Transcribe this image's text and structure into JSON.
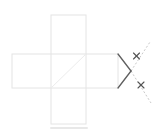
{
  "canvas": {
    "width": 160,
    "height": 134,
    "background": "#ffffff"
  },
  "colors": {
    "net_outline": "#e4e4e4",
    "fold_diagonal": "#ececec",
    "solid_ray": "#5f5f5f",
    "dashed_ray": "#c9c9c9",
    "cross_mark": "#545454",
    "shadow": "#d9d9d9"
  },
  "net": {
    "rects": [
      {
        "name": "horizontal-bar",
        "x": 12,
        "y": 54,
        "width": 106,
        "height": 34
      },
      {
        "name": "vertical-bar",
        "x": 51,
        "y": 15,
        "width": 35,
        "height": 109
      }
    ],
    "diagonal": {
      "x1": 51,
      "y1": 88,
      "x2": 86,
      "y2": 54
    }
  },
  "rays": {
    "solid": [
      {
        "name": "upper",
        "x1": 118,
        "y1": 54,
        "x2": 131,
        "y2": 71
      },
      {
        "name": "lower",
        "x1": 118,
        "y1": 88,
        "x2": 131,
        "y2": 71
      }
    ],
    "dashed": [
      {
        "name": "upper",
        "x1": 131,
        "y1": 71,
        "x2": 150,
        "y2": 42
      },
      {
        "name": "lower",
        "x1": 131,
        "y1": 71,
        "x2": 151,
        "y2": 103
      }
    ],
    "dash_pattern": "2 2"
  },
  "cross_marks": [
    {
      "name": "upper",
      "cx": 136.5,
      "cy": 56,
      "size": 6
    },
    {
      "name": "lower",
      "cx": 141,
      "cy": 85,
      "size": 6
    }
  ],
  "shadow": {
    "x": 50,
    "y": 127,
    "width": 38,
    "height": 2,
    "opacity": 0.6
  }
}
